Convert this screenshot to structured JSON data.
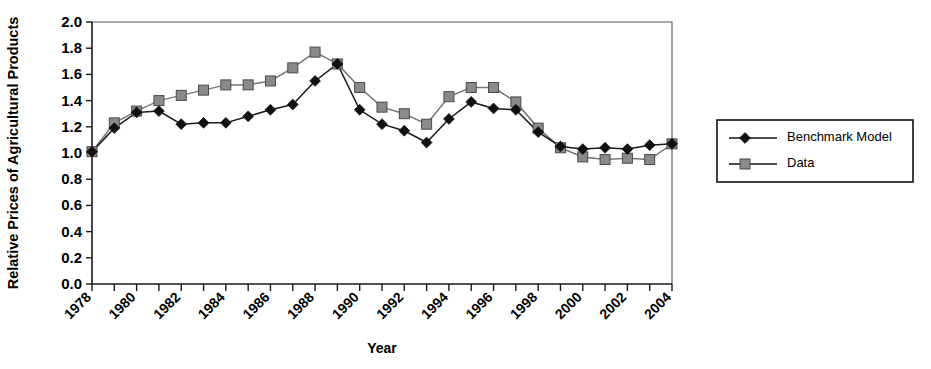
{
  "chart_data": {
    "type": "line",
    "title": "",
    "xlabel": "Year",
    "ylabel": "Relative Prices of Agricultural Products",
    "xlim": [
      1978,
      2004
    ],
    "ylim": [
      0.0,
      2.0
    ],
    "ytick_step": 0.2,
    "xtick_step": 1,
    "xlabel_step": 2,
    "grid": false,
    "legend_position": "right-outside",
    "x": [
      1978,
      1979,
      1980,
      1981,
      1982,
      1983,
      1984,
      1985,
      1986,
      1987,
      1988,
      1989,
      1990,
      1991,
      1992,
      1993,
      1994,
      1995,
      1996,
      1997,
      1998,
      1999,
      2000,
      2001,
      2002,
      2003,
      2004
    ],
    "xtick_labels": [
      "1978",
      "1979",
      "1980",
      "1981",
      "1982",
      "1983",
      "1984",
      "1985",
      "1986",
      "1987",
      "1988",
      "1989",
      "1990",
      "1991",
      "1992",
      "1993",
      "1994",
      "1995",
      "1996",
      "1997",
      "1998",
      "1999",
      "2000",
      "2001",
      "2002",
      "2003",
      "2004"
    ],
    "xtick_labels_shown": [
      "1978",
      "1980",
      "1982",
      "1984",
      "1986",
      "1988",
      "1990",
      "1992",
      "1994",
      "1996",
      "1998",
      "2000",
      "2002",
      "2004"
    ],
    "ytick_labels": [
      "0.0",
      "0.2",
      "0.4",
      "0.6",
      "0.8",
      "1.0",
      "1.2",
      "1.4",
      "1.6",
      "1.8",
      "2.0"
    ],
    "series": [
      {
        "name": "Benchmark Model",
        "marker": "diamond",
        "color": "#111111",
        "values": [
          1.01,
          1.19,
          1.31,
          1.32,
          1.22,
          1.23,
          1.23,
          1.28,
          1.33,
          1.37,
          1.55,
          1.68,
          1.33,
          1.22,
          1.17,
          1.08,
          1.26,
          1.39,
          1.34,
          1.33,
          1.16,
          1.05,
          1.03,
          1.04,
          1.03,
          1.06,
          1.07
        ]
      },
      {
        "name": "Data",
        "marker": "square",
        "color": "#8a8a8a",
        "values": [
          1.01,
          1.23,
          1.32,
          1.4,
          1.44,
          1.48,
          1.52,
          1.52,
          1.55,
          1.65,
          1.77,
          1.68,
          1.5,
          1.35,
          1.3,
          1.22,
          1.43,
          1.5,
          1.5,
          1.39,
          1.19,
          1.04,
          0.97,
          0.95,
          0.96,
          0.95,
          1.07
        ]
      }
    ]
  },
  "legend": {
    "entries": [
      {
        "label": "Benchmark Model",
        "marker": "diamond"
      },
      {
        "label": "Data",
        "marker": "square"
      }
    ]
  }
}
